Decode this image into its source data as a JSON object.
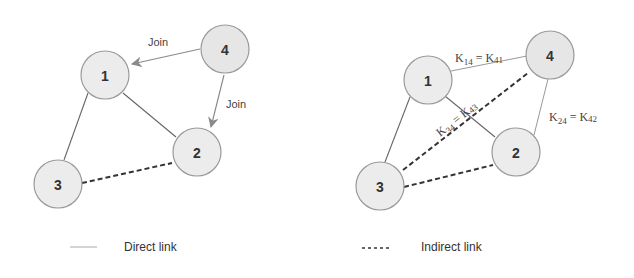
{
  "diagram": {
    "left_panel": {
      "nodes": [
        {
          "id": "1",
          "label": "1"
        },
        {
          "id": "2",
          "label": "2"
        },
        {
          "id": "3",
          "label": "3"
        },
        {
          "id": "4",
          "label": "4"
        }
      ],
      "edges": [
        {
          "from": "1",
          "to": "3",
          "type": "direct"
        },
        {
          "from": "1",
          "to": "2",
          "type": "direct"
        },
        {
          "from": "3",
          "to": "2",
          "type": "indirect"
        },
        {
          "from": "4",
          "to": "1",
          "type": "join",
          "label": "Join"
        },
        {
          "from": "4",
          "to": "2",
          "type": "join",
          "label": "Join"
        }
      ],
      "join_label_1": "Join",
      "join_label_2": "Join"
    },
    "right_panel": {
      "nodes": [
        {
          "id": "1",
          "label": "1"
        },
        {
          "id": "2",
          "label": "2"
        },
        {
          "id": "3",
          "label": "3"
        },
        {
          "id": "4",
          "label": "4"
        }
      ],
      "edges": [
        {
          "from": "1",
          "to": "3",
          "type": "direct"
        },
        {
          "from": "1",
          "to": "2",
          "type": "direct"
        },
        {
          "from": "1",
          "to": "4",
          "type": "direct",
          "label": "K14 = K41"
        },
        {
          "from": "2",
          "to": "4",
          "type": "direct",
          "label": "K24 = K42"
        },
        {
          "from": "3",
          "to": "4",
          "type": "indirect",
          "label": "K34 = K43"
        },
        {
          "from": "3",
          "to": "2",
          "type": "indirect"
        }
      ],
      "key_14": {
        "k": "K",
        "sub1": "14",
        "eq": " = K",
        "sub2": "41"
      },
      "key_24": {
        "k": "K",
        "sub1": "24",
        "eq": " = K",
        "sub2": "42"
      },
      "key_34": {
        "k": "K",
        "sub1": "34",
        "eq": " = K",
        "sub2": "43"
      }
    },
    "legend": {
      "direct": "Direct link",
      "indirect": "Indirect link"
    }
  }
}
